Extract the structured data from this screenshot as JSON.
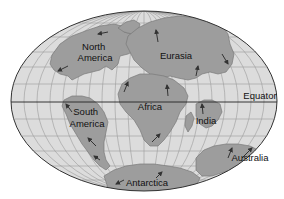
{
  "map": {
    "projection": "elliptical world map with latitude/longitude grid",
    "colors": {
      "background": "#ffffff",
      "ocean": "#dcdcdc",
      "land": "#9d9d9d",
      "land_edge": "#7a7a7a",
      "grid": "#9a9a9a",
      "outline": "#333333",
      "equator": "#222222",
      "arrow": "#333333",
      "text": "#111111"
    },
    "labels": {
      "north_america_line1": "North",
      "north_america_line2": "America",
      "eurasia": "Eurasia",
      "africa": "Africa",
      "south_america_line1": "South",
      "south_america_line2": "America",
      "india": "India",
      "australia": "Australia",
      "antarctica": "Antarctica",
      "equator": "Equator"
    },
    "landmasses": [
      "North America",
      "Eurasia",
      "Africa",
      "South America",
      "India",
      "Australia",
      "Antarctica"
    ],
    "annotations": [
      "Equator line",
      "plate motion arrows"
    ]
  }
}
